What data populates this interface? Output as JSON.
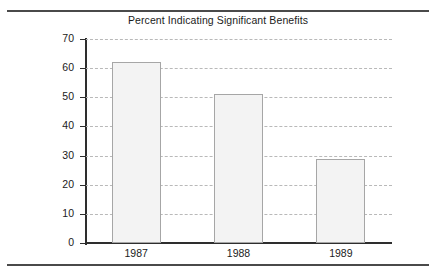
{
  "figure": {
    "title": "Percent Indicating Significant Benefits",
    "top_rule": "horizontal-rule",
    "bottom_rule": "horizontal-rule"
  },
  "colors": {
    "bar_fill": "#f3f3f3",
    "bar_border": "#a6a6a6",
    "axis": "#2e2e2e",
    "gridline": "#b9b9b9",
    "rule": "#4a4a4a",
    "text": "#1b1b1b",
    "background": "#ffffff"
  },
  "chart_data": {
    "type": "bar",
    "title": "Percent Indicating Significant Benefits",
    "xlabel": "",
    "ylabel": "",
    "categories": [
      "1987",
      "1988",
      "1989"
    ],
    "values": [
      62,
      51,
      29
    ],
    "ylim": [
      0,
      70
    ],
    "ytick_step": 10,
    "yticks": [
      0,
      10,
      20,
      30,
      40,
      50,
      60,
      70
    ],
    "ytick_labels": [
      "0",
      "10",
      "20",
      "30",
      "40",
      "50",
      "60",
      "70"
    ],
    "grid": "horizontal-dashed",
    "legend": "none",
    "series": [
      {
        "name": "Percent Indicating Significant Benefits",
        "values": [
          62,
          51,
          29
        ]
      }
    ]
  }
}
